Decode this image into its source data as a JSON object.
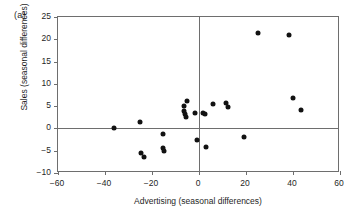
{
  "panel": {
    "label": "(a)"
  },
  "chart_data": {
    "type": "scatter",
    "title": "",
    "panel_label": "(a)",
    "xlabel": "Advertising (seasonal differences)",
    "ylabel": "Sales (seasonal differences)",
    "xlim": [
      -60,
      60
    ],
    "ylim": [
      -10,
      25
    ],
    "xticks": [
      -60,
      -40,
      -20,
      0,
      20,
      40,
      60
    ],
    "yticks": [
      -10,
      -5,
      0,
      5,
      10,
      15,
      20,
      25
    ],
    "xtick_labels": [
      "-60",
      "-40",
      "-20",
      "0",
      "20",
      "40",
      "60"
    ],
    "ytick_labels": [
      "-10",
      "-5",
      "0",
      "5",
      "10",
      "15",
      "20",
      "25"
    ],
    "grid": false,
    "legend": null,
    "reference_lines": [
      {
        "axis": "y",
        "value": 0
      },
      {
        "axis": "x",
        "value": 0
      }
    ],
    "marker": {
      "shape": "circle",
      "filled": true,
      "color": "#121212",
      "size": 5
    },
    "points": [
      {
        "x": -36.0,
        "y": 0.0
      },
      {
        "x": -25.0,
        "y": 1.5
      },
      {
        "x": -24.5,
        "y": -5.5
      },
      {
        "x": -23.5,
        "y": -6.4
      },
      {
        "x": -15.5,
        "y": -1.2
      },
      {
        "x": -15.5,
        "y": -4.3
      },
      {
        "x": -15.0,
        "y": -5.0
      },
      {
        "x": -6.5,
        "y": 5.0
      },
      {
        "x": -6.5,
        "y": 4.0
      },
      {
        "x": -6.0,
        "y": 3.3
      },
      {
        "x": -5.5,
        "y": 2.5
      },
      {
        "x": -5.0,
        "y": 6.2
      },
      {
        "x": -1.5,
        "y": 3.4
      },
      {
        "x": -1.0,
        "y": -2.5
      },
      {
        "x": 1.5,
        "y": 3.4
      },
      {
        "x": 2.5,
        "y": 3.3
      },
      {
        "x": 3.0,
        "y": -4.1
      },
      {
        "x": 6.0,
        "y": 5.4
      },
      {
        "x": 11.5,
        "y": 5.6
      },
      {
        "x": 12.5,
        "y": 4.9
      },
      {
        "x": 19.0,
        "y": -2.0
      },
      {
        "x": 25.0,
        "y": 21.3
      },
      {
        "x": 38.5,
        "y": 21.0
      },
      {
        "x": 40.0,
        "y": 6.8
      },
      {
        "x": 43.5,
        "y": 4.2
      }
    ]
  }
}
